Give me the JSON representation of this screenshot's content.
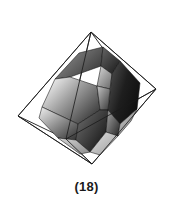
{
  "figure": {
    "caption": "(18)",
    "label_number": "18",
    "background_color": "#ffffff",
    "line_color": "#1a1a1a",
    "wireframe": {
      "name": "circumscribed-octahedron",
      "stroke_color": "#1a1a1a",
      "stroke_width": 0.8,
      "vertices": {
        "top": [
          91,
          32
        ],
        "bottom": [
          92,
          164
        ],
        "left": [
          18,
          116
        ],
        "right": [
          156,
          89
        ],
        "front": [
          66,
          139
        ],
        "back": [
          110,
          58
        ]
      }
    },
    "solid": {
      "name": "truncated-crystal-solid",
      "outline_color": "#111111",
      "faces": [
        {
          "id": "face-top-left-upper",
          "tone": "mid-dark",
          "fill_start": "#8e8e8e",
          "fill_end": "#3a3a3a"
        },
        {
          "id": "face-top-cap",
          "tone": "dark",
          "fill_start": "#5d5d5d",
          "fill_end": "#1f1f1f"
        },
        {
          "id": "face-top-right-upper",
          "tone": "light",
          "fill_start": "#d2d2d2",
          "fill_end": "#7a7a7a"
        },
        {
          "id": "face-right-large-hex",
          "tone": "very-dark",
          "fill_start": "#4a4a4a",
          "fill_end": "#111111"
        },
        {
          "id": "face-left-large-hex",
          "tone": "gradient-light-dark",
          "fill_start": "#efefef",
          "fill_end": "#2b2b2b"
        },
        {
          "id": "face-center-band",
          "tone": "mid",
          "fill_start": "#bdbdbd",
          "fill_end": "#404040"
        },
        {
          "id": "face-lower-left",
          "tone": "gradient-mid",
          "fill_start": "#e2e2e2",
          "fill_end": "#353535"
        },
        {
          "id": "face-lower-center",
          "tone": "dark",
          "fill_start": "#6a6a6a",
          "fill_end": "#161616"
        },
        {
          "id": "face-lower-right",
          "tone": "mid-dark",
          "fill_start": "#9a9a9a",
          "fill_end": "#272727"
        },
        {
          "id": "face-bottom-tip-left",
          "tone": "light-sliver",
          "fill_start": "#cfcfcf",
          "fill_end": "#8a8a8a"
        },
        {
          "id": "face-bottom-tip-right",
          "tone": "light-sliver",
          "fill_start": "#dcdcdc",
          "fill_end": "#9b9b9b"
        },
        {
          "id": "face-right-sliver",
          "tone": "light-sliver",
          "fill_start": "#c9c9c9",
          "fill_end": "#7e7e7e"
        }
      ]
    }
  }
}
